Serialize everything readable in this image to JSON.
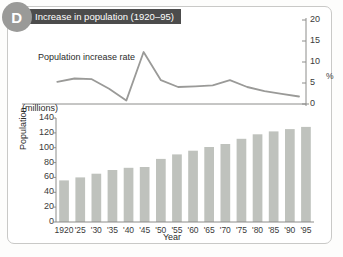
{
  "panel": {
    "badge_letter": "D",
    "title": "Increase in population (1920–95)",
    "badge_color": "#9a9a98",
    "banner_color": "#4c4c4c",
    "border_color": "#c9c9c7",
    "bar_color": "#bfc2bd",
    "line_color": "#9a9a98"
  },
  "chart_data": [
    {
      "type": "line",
      "title": "Increase in population (1920–95)",
      "series_label": "Population increase rate",
      "xlabel": "",
      "ylabel": "%",
      "ylim": [
        0,
        20
      ],
      "yticks": [
        0,
        5,
        10,
        15,
        20
      ],
      "grid": false,
      "x": [
        "1920",
        "'25",
        "'30",
        "'35",
        "'40",
        "'45",
        "'50",
        "'55",
        "'60",
        "'65",
        "'70",
        "'75",
        "'80",
        "'85",
        "'90",
        "'95"
      ],
      "values": [
        null,
        6.5,
        7.5,
        7.3,
        4.5,
        1.0,
        15.3,
        7.0,
        5.0,
        5.2,
        5.5,
        7.0,
        5.0,
        3.8,
        3.0,
        2.2
      ]
    },
    {
      "type": "bar",
      "title": "",
      "xlabel": "Year",
      "ylabel": "Population",
      "yunit": "(millions)",
      "ylim": [
        0,
        140
      ],
      "yticks": [
        0,
        20,
        40,
        60,
        80,
        100,
        120,
        140
      ],
      "grid": false,
      "categories": [
        "1920",
        "'25",
        "'30",
        "'35",
        "'40",
        "'45",
        "'50",
        "'55",
        "'60",
        "'65",
        "'70",
        "'75",
        "'80",
        "'85",
        "'90",
        "'95"
      ],
      "values": [
        56,
        60,
        65,
        70,
        73,
        74,
        85,
        91,
        96,
        101,
        105,
        112,
        118,
        122,
        125,
        128
      ]
    }
  ]
}
